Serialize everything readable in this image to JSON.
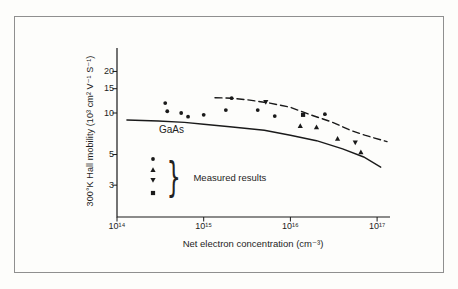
{
  "figure": {
    "background": "#fdfdfb",
    "border_color": "#8f8f8f",
    "ink_color": "#1a1a1a"
  },
  "chart_data": {
    "type": "scatter",
    "title": "",
    "xlabel": "Net electron concentration (cm⁻³)",
    "ylabel": "300°K Hall mobility (10³ cm² V⁻¹ S⁻¹)",
    "x_scale": "log",
    "y_scale": "log",
    "xlim": [
      100000000000000.0,
      1.4e+17
    ],
    "ylim": [
      1.8,
      29
    ],
    "grid": false,
    "x_ticks": [
      {
        "value": 100000000000000.0,
        "label": "10¹⁴"
      },
      {
        "value": 1000000000000000.0,
        "label": "10¹⁵"
      },
      {
        "value": 1e+16,
        "label": "10¹⁶"
      },
      {
        "value": 1e+17,
        "label": "10¹⁷"
      }
    ],
    "y_ticks": [
      {
        "value": 20,
        "label": "20"
      },
      {
        "value": 15,
        "label": "15"
      },
      {
        "value": 10,
        "label": "10"
      },
      {
        "value": 5,
        "label": "5"
      },
      {
        "value": 3,
        "label": "3"
      }
    ],
    "curve_labels": {
      "solid": "GaAs"
    },
    "legend": {
      "label": "Measured results",
      "markers": [
        "circle",
        "triangle-up",
        "triangle-down",
        "square"
      ]
    },
    "series": [
      {
        "name": "measured-circles",
        "marker": "circle",
        "points": [
          [
            360000000000000.0,
            11.8
          ],
          [
            380000000000000.0,
            10.3
          ],
          [
            550000000000000.0,
            10.0
          ],
          [
            660000000000000.0,
            9.4
          ],
          [
            1000000000000000.0,
            9.7
          ],
          [
            1800000000000000.0,
            10.5
          ],
          [
            2100000000000000.0,
            12.8
          ],
          [
            4200000000000000.0,
            10.5
          ],
          [
            6600000000000000.0,
            9.5
          ],
          [
            2.5e+16,
            9.8
          ]
        ]
      },
      {
        "name": "measured-triangles-up",
        "marker": "triangle-up",
        "points": [
          [
            1.3e+16,
            8.05
          ],
          [
            2e+16,
            7.9
          ],
          [
            3.5e+16,
            6.5
          ],
          [
            6.5e+16,
            5.2
          ]
        ]
      },
      {
        "name": "measured-triangles-down",
        "marker": "triangle-down",
        "points": [
          [
            5200000000000000.0,
            12.0
          ],
          [
            5.6e+16,
            6.1
          ]
        ]
      },
      {
        "name": "measured-squares",
        "marker": "square",
        "points": [
          [
            1.4e+16,
            9.7
          ]
        ]
      },
      {
        "name": "gaas-theory-curve",
        "type": "line",
        "style": "solid",
        "points": [
          [
            130000000000000.0,
            8.9
          ],
          [
            300000000000000.0,
            8.75
          ],
          [
            600000000000000.0,
            8.55
          ],
          [
            1000000000000000.0,
            8.3
          ],
          [
            2000000000000000.0,
            7.95
          ],
          [
            5000000000000000.0,
            7.5
          ],
          [
            1e+16,
            6.9
          ],
          [
            2e+16,
            6.3
          ],
          [
            4e+16,
            5.5
          ],
          [
            7e+16,
            4.8
          ],
          [
            1.1e+17,
            4.05
          ]
        ]
      },
      {
        "name": "upper-bound-curve",
        "type": "line",
        "style": "dashed",
        "points": [
          [
            1350000000000000.0,
            12.9
          ],
          [
            2100000000000000.0,
            12.8
          ],
          [
            3400000000000000.0,
            12.4
          ],
          [
            5800000000000000.0,
            11.8
          ],
          [
            1e+16,
            11.0
          ],
          [
            1.7e+16,
            9.7
          ],
          [
            3e+16,
            8.6
          ],
          [
            4.9e+16,
            7.5
          ],
          [
            7.2e+16,
            6.9
          ],
          [
            1.3e+17,
            6.2
          ]
        ]
      }
    ]
  }
}
